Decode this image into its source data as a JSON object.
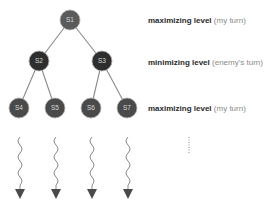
{
  "diagram": {
    "type": "minimax-game-tree",
    "nodes": [
      {
        "id": "S1",
        "label": "S1",
        "level": 0,
        "x": 70,
        "y": 20,
        "color": "#5a5a5a"
      },
      {
        "id": "S2",
        "label": "S2",
        "level": 1,
        "x": 39,
        "y": 61,
        "color": "#2e2e2e"
      },
      {
        "id": "S3",
        "label": "S3",
        "level": 1,
        "x": 102,
        "y": 61,
        "color": "#2e2e2e"
      },
      {
        "id": "S4",
        "label": "S4",
        "level": 2,
        "x": 19,
        "y": 108,
        "color": "#4a4a4a"
      },
      {
        "id": "S5",
        "label": "S5",
        "level": 2,
        "x": 55,
        "y": 108,
        "color": "#4a4a4a"
      },
      {
        "id": "S6",
        "label": "S6",
        "level": 2,
        "x": 91,
        "y": 108,
        "color": "#4a4a4a"
      },
      {
        "id": "S7",
        "label": "S7",
        "level": 2,
        "x": 127,
        "y": 108,
        "color": "#4a4a4a"
      }
    ],
    "edges": [
      [
        "S1",
        "S2"
      ],
      [
        "S1",
        "S3"
      ],
      [
        "S2",
        "S4"
      ],
      [
        "S2",
        "S5"
      ],
      [
        "S3",
        "S6"
      ],
      [
        "S3",
        "S7"
      ]
    ],
    "levels": [
      {
        "strong": "maximizing level",
        "paren": "(my turn)",
        "y": 17
      },
      {
        "strong": "minimizing level",
        "paren": "(enemy's turn)",
        "y": 60
      },
      {
        "strong": "maximizing level",
        "paren": "(my turn)",
        "y": 104
      }
    ],
    "continuation": {
      "arrows_from": [
        "S4",
        "S5",
        "S6",
        "S7"
      ],
      "ellipsis": "vertical-dots"
    }
  }
}
